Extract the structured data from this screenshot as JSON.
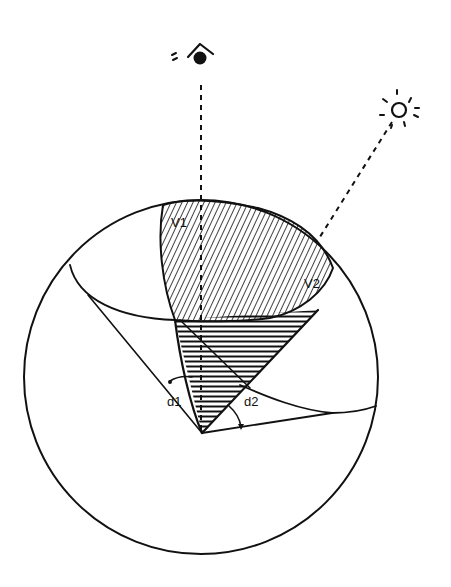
{
  "diagram": {
    "colors": {
      "ink": "#111111",
      "background": "#ffffff"
    },
    "labels": {
      "v1": "V1",
      "v2": "V2",
      "d1": "d1",
      "d2": "d2"
    },
    "icons": {
      "viewer": "eye-icon",
      "light": "sun-icon"
    },
    "sphere": {
      "cx": 201,
      "cy": 377,
      "r": 177
    },
    "apex": {
      "x": 202,
      "y": 433
    }
  }
}
